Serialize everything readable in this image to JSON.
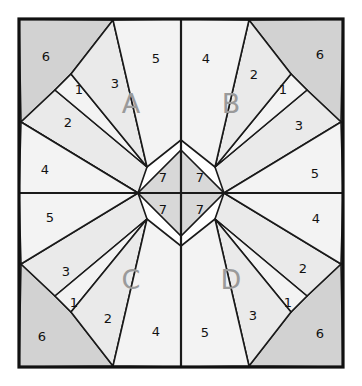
{
  "figure": {
    "background_color": "#ffffff",
    "border_color": "#111111",
    "line_color": "#1a1a1a",
    "label_color": "#111111",
    "quadrant_label_color": "#9a9a9a",
    "frame": {
      "x": 19,
      "y": 19,
      "width": 324,
      "height": 348
    },
    "center": {
      "x": 181,
      "y": 193
    },
    "diamond_half_width": 43,
    "diamond_half_height": 43
  },
  "palette": {
    "light": "#f3f3f3",
    "mid_light": "#eaeaea",
    "mid": "#e2e2e2",
    "dark": "#d2d2d2",
    "darker": "#cbcbcb",
    "center": "#d8d8d8"
  },
  "quadrants": [
    {
      "id": "A",
      "label": "A",
      "label_pos": {
        "x": 131,
        "y": 105
      },
      "pieces": [
        {
          "n": "1",
          "label": "1",
          "pos": {
            "x": 79,
            "y": 90
          }
        },
        {
          "n": "2",
          "label": "2",
          "pos": {
            "x": 68,
            "y": 123
          }
        },
        {
          "n": "3",
          "label": "3",
          "pos": {
            "x": 115,
            "y": 84
          }
        },
        {
          "n": "4",
          "label": "4",
          "pos": {
            "x": 45,
            "y": 170
          }
        },
        {
          "n": "5",
          "label": "5",
          "pos": {
            "x": 156,
            "y": 59
          }
        },
        {
          "n": "6",
          "label": "6",
          "pos": {
            "x": 46,
            "y": 57
          }
        }
      ]
    },
    {
      "id": "B",
      "label": "B",
      "label_pos": {
        "x": 231,
        "y": 105
      },
      "pieces": [
        {
          "n": "1",
          "label": "1",
          "pos": {
            "x": 283,
            "y": 90
          }
        },
        {
          "n": "2",
          "label": "2",
          "pos": {
            "x": 254,
            "y": 75
          }
        },
        {
          "n": "3",
          "label": "3",
          "pos": {
            "x": 299,
            "y": 126
          }
        },
        {
          "n": "4",
          "label": "4",
          "pos": {
            "x": 206,
            "y": 59
          }
        },
        {
          "n": "5",
          "label": "5",
          "pos": {
            "x": 315,
            "y": 174
          }
        },
        {
          "n": "6",
          "label": "6",
          "pos": {
            "x": 320,
            "y": 55
          }
        }
      ]
    },
    {
      "id": "C",
      "label": "C",
      "label_pos": {
        "x": 131,
        "y": 281
      },
      "pieces": [
        {
          "n": "1",
          "label": "1",
          "pos": {
            "x": 74,
            "y": 303
          }
        },
        {
          "n": "2",
          "label": "2",
          "pos": {
            "x": 108,
            "y": 319
          }
        },
        {
          "n": "3",
          "label": "3",
          "pos": {
            "x": 66,
            "y": 272
          }
        },
        {
          "n": "4",
          "label": "4",
          "pos": {
            "x": 156,
            "y": 332
          }
        },
        {
          "n": "5",
          "label": "5",
          "pos": {
            "x": 50,
            "y": 218
          }
        },
        {
          "n": "6",
          "label": "6",
          "pos": {
            "x": 42,
            "y": 337
          }
        }
      ]
    },
    {
      "id": "D",
      "label": "D",
      "label_pos": {
        "x": 231,
        "y": 281
      },
      "pieces": [
        {
          "n": "1",
          "label": "1",
          "pos": {
            "x": 288,
            "y": 303
          }
        },
        {
          "n": "2",
          "label": "2",
          "pos": {
            "x": 303,
            "y": 269
          }
        },
        {
          "n": "3",
          "label": "3",
          "pos": {
            "x": 253,
            "y": 316
          }
        },
        {
          "n": "4",
          "label": "4",
          "pos": {
            "x": 316,
            "y": 219
          }
        },
        {
          "n": "5",
          "label": "5",
          "pos": {
            "x": 205,
            "y": 333
          }
        },
        {
          "n": "6",
          "label": "6",
          "pos": {
            "x": 320,
            "y": 334
          }
        }
      ]
    }
  ],
  "center_pieces": [
    {
      "id": "center-nw",
      "label": "7",
      "pos": {
        "x": 163,
        "y": 178
      }
    },
    {
      "id": "center-ne",
      "label": "7",
      "pos": {
        "x": 200,
        "y": 178
      }
    },
    {
      "id": "center-sw",
      "label": "7",
      "pos": {
        "x": 163,
        "y": 210
      }
    },
    {
      "id": "center-se",
      "label": "7",
      "pos": {
        "x": 200,
        "y": 210
      }
    }
  ]
}
